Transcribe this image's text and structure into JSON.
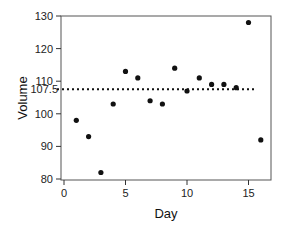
{
  "chart_data": {
    "type": "scatter",
    "title": "",
    "xlabel": "Day",
    "ylabel": "Volume",
    "xlim": [
      0,
      16.5
    ],
    "ylim": [
      79.5,
      130.5
    ],
    "x_ticks": [
      0,
      5,
      10,
      15
    ],
    "y_ticks": [
      80,
      90,
      100,
      110,
      120,
      130
    ],
    "grid": false,
    "legend": null,
    "series": [
      {
        "name": "Volume",
        "x": [
          1,
          2,
          3,
          4,
          5,
          6,
          7,
          8,
          9,
          10,
          11,
          12,
          13,
          14,
          15,
          16
        ],
        "y": [
          98,
          93,
          82,
          103,
          113,
          111,
          104,
          103,
          114,
          107,
          111,
          109,
          109,
          108,
          128,
          92
        ]
      }
    ],
    "reference_lines": [
      {
        "orientation": "horizontal",
        "value": 107.5,
        "style": "dotted",
        "label": "107.5"
      }
    ]
  },
  "labels": {
    "xlabel": "Day",
    "ylabel": "Volume",
    "ref_label": "107.5"
  },
  "colors": {
    "point": "#111111",
    "axis": "#333333",
    "ref_line": "#111111"
  }
}
